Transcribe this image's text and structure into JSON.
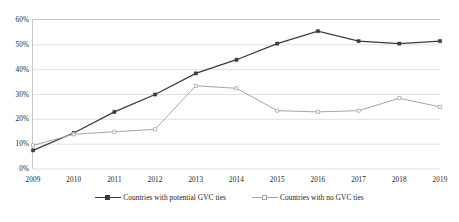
{
  "chart_data": {
    "type": "line",
    "title": "",
    "subtitle": "",
    "xlabel": "",
    "ylabel": "",
    "categories": [
      "2009",
      "2010",
      "2011",
      "2012",
      "2013",
      "2014",
      "2015",
      "2016",
      "2017",
      "2018",
      "2019"
    ],
    "ylim": [
      0,
      60
    ],
    "ytick_labels": [
      "0%",
      "10%",
      "20%",
      "30%",
      "40%",
      "50%",
      "60%"
    ],
    "ytick_values": [
      0,
      10,
      20,
      30,
      40,
      50,
      60
    ],
    "grid": true,
    "legend_position": "bottom",
    "series": [
      {
        "name": "Countries with potential GVC ties",
        "color": "#3b3b3b",
        "marker": "square",
        "values": [
          7.5,
          14.5,
          23.0,
          30.0,
          38.5,
          44.0,
          50.5,
          55.5,
          51.5,
          50.5,
          51.5
        ]
      },
      {
        "name": "Countries with no GVC ties",
        "color": "#a6a6a6",
        "marker": "square-open",
        "values": [
          9.5,
          14.0,
          15.0,
          16.0,
          33.5,
          32.5,
          23.5,
          23.0,
          23.5,
          28.5,
          25.0
        ]
      }
    ]
  },
  "legend": {
    "items": [
      {
        "label": "Countries with potential GVC ties"
      },
      {
        "label": "Countries with no GVC ties"
      }
    ]
  },
  "axis": {
    "y_labels": [
      "60%",
      "50%",
      "40%",
      "30%",
      "20%",
      "10%",
      "0%"
    ],
    "x_labels": [
      "2009",
      "2010",
      "2011",
      "2012",
      "2013",
      "2014",
      "2015",
      "2016",
      "2017",
      "2018",
      "2019"
    ]
  },
  "colors": {
    "series_dark": "#3b3b3b",
    "series_light": "#a6a6a6",
    "gridline": "#d9d9d9",
    "frame": "#c8c8c8",
    "text": "#222222",
    "background": "#ffffff"
  }
}
